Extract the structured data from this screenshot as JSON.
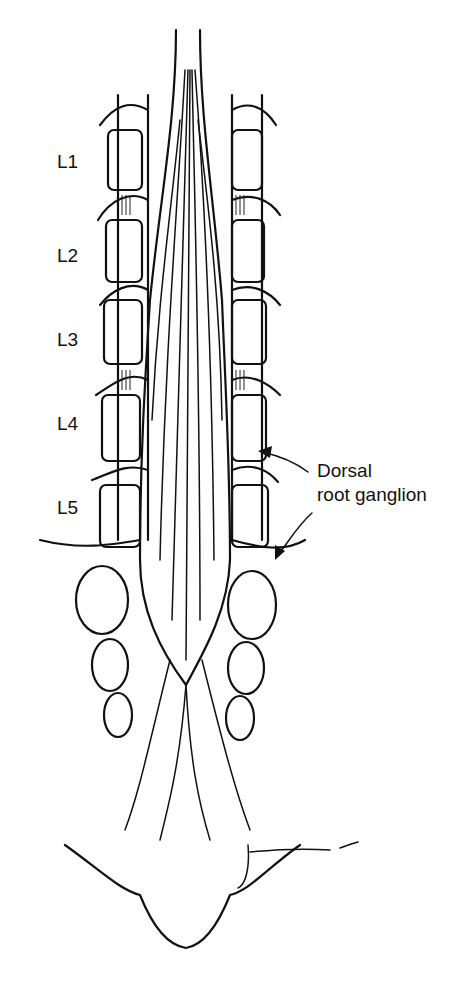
{
  "figure": {
    "vertebra_labels": [
      "L1",
      "L2",
      "L3",
      "L4",
      "L5"
    ],
    "annotation": {
      "line1": "Dorsal",
      "line2": "root ganglion"
    },
    "signature": "J. Francis",
    "colors": {
      "ink": "#111111",
      "background": "#ffffff"
    }
  }
}
